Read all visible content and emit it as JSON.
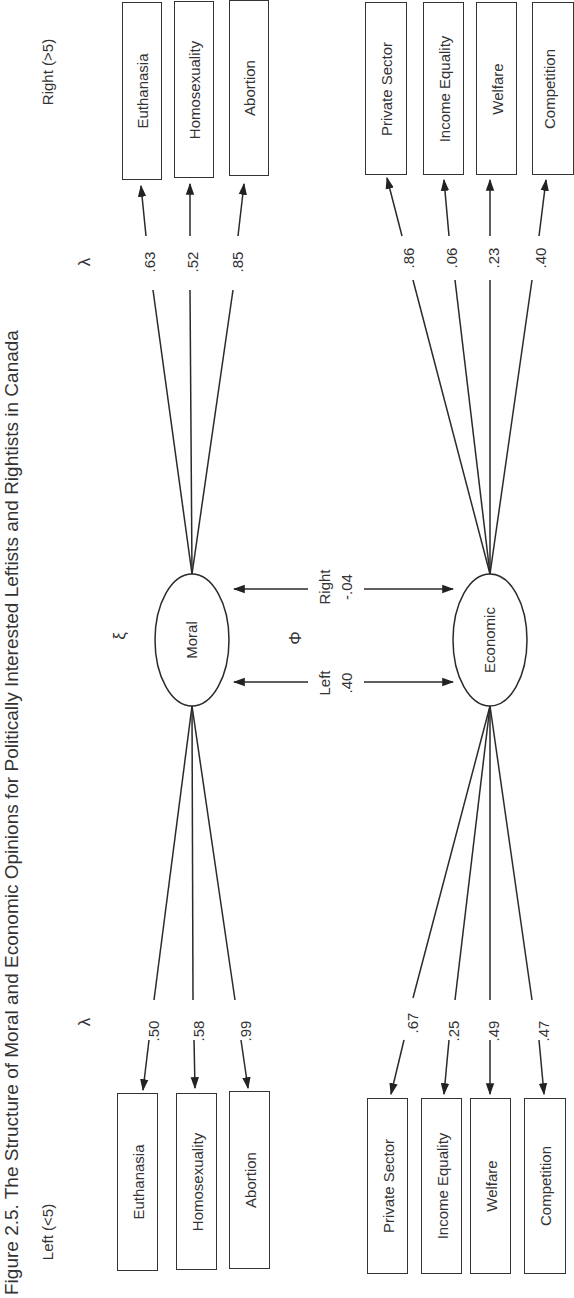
{
  "figure": {
    "title": "Figure 2.5. The Structure of Moral and Economic Opinions for Politically Interested Leftists and Rightists in Canada",
    "groups": {
      "right": {
        "label": "Right (>5)"
      },
      "left": {
        "label": "Left (<5)"
      }
    },
    "symbols": {
      "lambda": "λ",
      "xi": "ξ",
      "phi": "Φ"
    },
    "latent": {
      "moral": "Moral",
      "economic": "Economic"
    },
    "correlations": {
      "right": {
        "label": "Right",
        "value": "-.04"
      },
      "left": {
        "label": "Left",
        "value": ".40"
      }
    },
    "right_group": {
      "moral_indicators": [
        {
          "label": "Euthanasia",
          "loading": ".63"
        },
        {
          "label": "Homosexuality",
          "loading": ".52"
        },
        {
          "label": "Abortion",
          "loading": ".85"
        }
      ],
      "economic_indicators": [
        {
          "label": "Private Sector",
          "loading": ".86"
        },
        {
          "label": "Income Equality",
          "loading": ".06"
        },
        {
          "label": "Welfare",
          "loading": ".23"
        },
        {
          "label": "Competition",
          "loading": ".40"
        }
      ]
    },
    "left_group": {
      "moral_indicators": [
        {
          "label": "Euthanasia",
          "loading": ".50"
        },
        {
          "label": "Homosexuality",
          "loading": ".58"
        },
        {
          "label": "Abortion",
          "loading": ".99"
        }
      ],
      "economic_indicators": [
        {
          "label": "Private Sector",
          "loading": ".67"
        },
        {
          "label": "Income Equality",
          "loading": ".25"
        },
        {
          "label": "Welfare",
          "loading": ".49"
        },
        {
          "label": "Competition",
          "loading": ".47"
        }
      ]
    }
  }
}
